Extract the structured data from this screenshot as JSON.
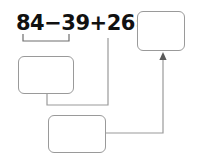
{
  "problem": {
    "expression_full": "84−39+26=",
    "operands": [
      "84",
      "39",
      "26"
    ],
    "operators": [
      "−",
      "+"
    ],
    "equals": "=",
    "term_1": "84",
    "op_1": "−",
    "term_2": "39",
    "op_2": "+",
    "term_3": "26",
    "eq_sign": "="
  },
  "boxes": {
    "left": {
      "label": "",
      "placeholder": ""
    },
    "bottom": {
      "label": "",
      "placeholder": ""
    },
    "result": {
      "label": "",
      "placeholder": ""
    }
  },
  "colors": {
    "box_border": "#9a9a9a",
    "connector": "#9a9a9a",
    "bracket": "#6e6e6e",
    "text": "#111111",
    "background": "#ffffff"
  },
  "connectors": {
    "bracket_under_84_minus_39": "groups 84 − 39 into the left answer box",
    "left_box_to_bottom_box": "left box result feeds the bottom box",
    "term_26_to_bottom_box": "the +26 term feeds the bottom box",
    "bottom_box_to_result_box": "bottom box result feeds the final answer box"
  }
}
